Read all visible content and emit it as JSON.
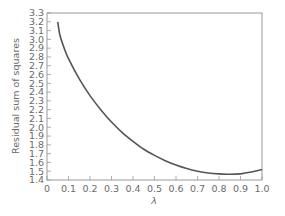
{
  "chart_data": {
    "type": "line",
    "title": "",
    "xlabel": "λ",
    "ylabel": "Residual sum of squares",
    "xlim": [
      0,
      1.0
    ],
    "ylim": [
      1.4,
      3.3
    ],
    "xticks": [
      "0",
      "0.1",
      "0.2",
      "0.3",
      "0.4",
      "0.5",
      "0.6",
      "0.7",
      "0.8",
      "0.9",
      "1.0"
    ],
    "yticks": [
      "1.4",
      "1.5",
      "1.6",
      "1.7",
      "1.8",
      "1.9",
      "2.0",
      "2.1",
      "2.2",
      "2.3",
      "2.4",
      "2.5",
      "2.6",
      "2.7",
      "2.8",
      "2.9",
      "3.0",
      "3.1",
      "3.2",
      "3.3"
    ],
    "grid": false,
    "legend": null,
    "series": [
      {
        "name": "Residual sum of squares",
        "color": "#555555",
        "x": [
          0.05,
          0.06,
          0.08,
          0.1,
          0.15,
          0.2,
          0.25,
          0.3,
          0.35,
          0.4,
          0.45,
          0.5,
          0.55,
          0.6,
          0.65,
          0.7,
          0.75,
          0.8,
          0.85,
          0.9,
          0.95,
          1.0
        ],
        "y": [
          3.2,
          3.05,
          2.9,
          2.78,
          2.55,
          2.36,
          2.2,
          2.06,
          1.94,
          1.84,
          1.75,
          1.68,
          1.62,
          1.57,
          1.53,
          1.5,
          1.48,
          1.47,
          1.465,
          1.47,
          1.49,
          1.52
        ]
      }
    ]
  }
}
